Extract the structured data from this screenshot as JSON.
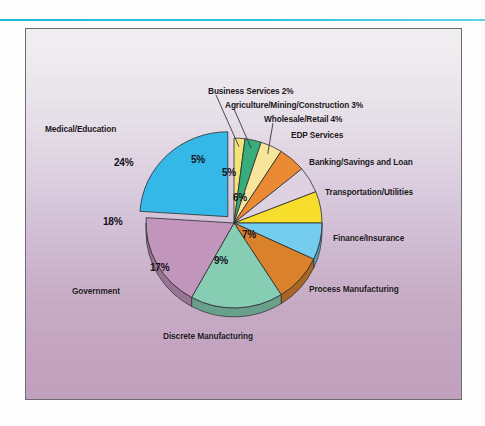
{
  "figure": {
    "panel_background_top": "#f4f1f4",
    "panel_background_bottom": "#c09fbd",
    "rule_color": "#2fc3de",
    "border_color": "#6e6b6e"
  },
  "chart_data": {
    "type": "pie",
    "title": "",
    "subtitle": "",
    "xlabel": "",
    "ylabel": "",
    "legend_position": "callout-labels",
    "grid": false,
    "total": 100,
    "units": "%",
    "exploded_slice": "Medical/Education",
    "start_angle_deg": 0,
    "direction": "clockwise",
    "categories": [
      "Business Services",
      "Agriculture/Mining/Construction",
      "Wholesale/Retail",
      "EDP Services",
      "Banking/Savings and Loan",
      "Transportation/Utilities",
      "Finance/Insurance",
      "Process Manufacturing",
      "Discrete Manufacturing",
      "Government",
      "Medical/Education"
    ],
    "values": [
      2,
      3,
      4,
      5,
      5,
      6,
      7,
      9,
      17,
      18,
      24
    ],
    "colors": [
      "#f4e37a",
      "#38ad7c",
      "#f6e59a",
      "#ea8a33",
      "#ded2e2",
      "#f7dd2c",
      "#74cdee",
      "#d9822b",
      "#86cdb4",
      "#c295bd",
      "#34b8e8"
    ],
    "slices": [
      {
        "label": "Business Services",
        "value": 2,
        "value_label": "2%",
        "color": "#f4e37a",
        "label_text": "Business Services 2%",
        "show_value_inside": false,
        "leader": true
      },
      {
        "label": "Agriculture/Mining/Construction",
        "value": 3,
        "value_label": "3%",
        "color": "#38ad7c",
        "label_text": "Agriculture/Mining/Construction 3%",
        "show_value_inside": false,
        "leader": true
      },
      {
        "label": "Wholesale/Retail",
        "value": 4,
        "value_label": "4%",
        "color": "#f6e59a",
        "label_text": "Wholesale/Retail 4%",
        "show_value_inside": false,
        "leader": true
      },
      {
        "label": "EDP Services",
        "value": 5,
        "value_label": "5%",
        "color": "#ea8a33",
        "label_text": "EDP Services",
        "show_value_inside": true,
        "leader": false
      },
      {
        "label": "Banking/Savings and Loan",
        "value": 5,
        "value_label": "5%",
        "color": "#ded2e2",
        "label_text": "Banking/Savings and Loan",
        "show_value_inside": true,
        "leader": false
      },
      {
        "label": "Transportation/Utilities",
        "value": 6,
        "value_label": "6%",
        "color": "#f7dd2c",
        "label_text": "Transportation/Utilities",
        "show_value_inside": true,
        "leader": false
      },
      {
        "label": "Finance/Insurance",
        "value": 7,
        "value_label": "7%",
        "color": "#74cdee",
        "label_text": "Finance/Insurance",
        "show_value_inside": true,
        "leader": false
      },
      {
        "label": "Process Manufacturing",
        "value": 9,
        "value_label": "9%",
        "color": "#d9822b",
        "label_text": "Process Manufacturing",
        "show_value_inside": true,
        "leader": false
      },
      {
        "label": "Discrete Manufacturing",
        "value": 17,
        "value_label": "17%",
        "color": "#86cdb4",
        "label_text": "Discrete Manufacturing",
        "show_value_inside": true,
        "leader": false
      },
      {
        "label": "Government",
        "value": 18,
        "value_label": "18%",
        "color": "#c295bd",
        "label_text": "Government",
        "show_value_inside": true,
        "leader": false
      },
      {
        "label": "Medical/Education",
        "value": 24,
        "value_label": "24%",
        "color": "#34b8e8",
        "label_text": "Medical/Education",
        "show_value_inside": true,
        "leader": false
      }
    ]
  }
}
